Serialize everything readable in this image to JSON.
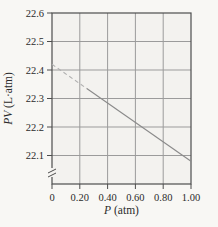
{
  "figure_type": "textbook-line-chart",
  "chart_data": {
    "type": "line",
    "title": "",
    "xlabel": "P (atm)",
    "xlabel_italic": "P",
    "xlabel_rest": " (atm)",
    "ylabel": "PV (L·atm)",
    "ylabel_italic": "PV",
    "ylabel_rest": " (L·atm)",
    "xlim": [
      0,
      1.0
    ],
    "ylim": [
      22.0,
      22.6
    ],
    "grid": true,
    "y_axis_break": true,
    "x_ticks": [
      0,
      0.2,
      0.4,
      0.6,
      0.8,
      1.0
    ],
    "x_tick_labels": [
      "0",
      "0.20",
      "0.40",
      "0.60",
      "0.80",
      "1.00"
    ],
    "y_ticks": [
      22.1,
      22.2,
      22.3,
      22.4,
      22.5,
      22.6
    ],
    "y_tick_labels": [
      "22.1",
      "22.2",
      "22.3",
      "22.4",
      "22.5",
      "22.6"
    ],
    "series": [
      {
        "name": "extrapolated-ideal",
        "style": "dashed",
        "points": [
          [
            0,
            22.42
          ],
          [
            0.25,
            22.335
          ]
        ]
      },
      {
        "name": "measured",
        "style": "solid",
        "points": [
          [
            0.25,
            22.335
          ],
          [
            1.0,
            22.08
          ]
        ]
      }
    ]
  },
  "colors": {
    "page_bg": "#f8f7f4",
    "plot_bg": "#f3f2ef",
    "grid": "#9b9b9b",
    "axis": "#4d4d4d",
    "line_solid": "#8a8a8a",
    "line_dashed": "#b0b0b0",
    "text": "#2b2b2b"
  }
}
